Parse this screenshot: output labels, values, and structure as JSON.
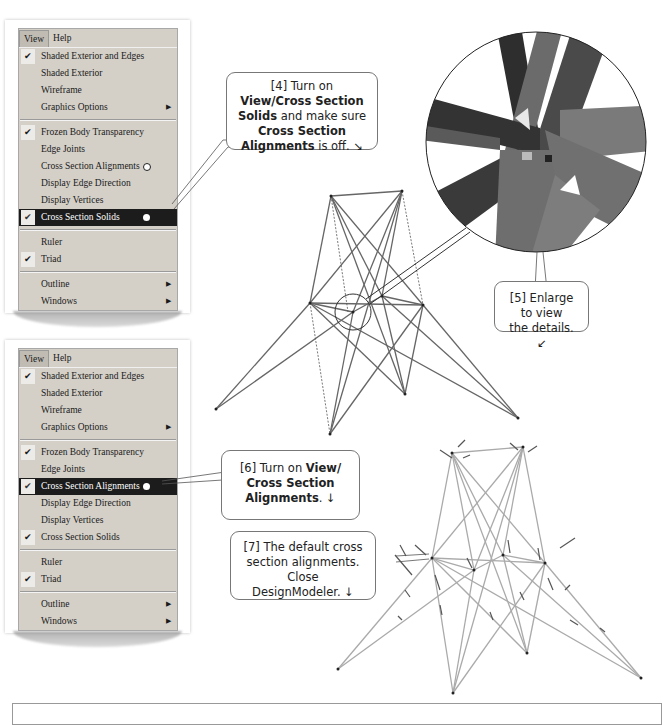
{
  "menu_1": {
    "menubar": [
      "View",
      "Help"
    ],
    "active_menu": "View",
    "items": [
      {
        "label": "Shaded Exterior and Edges",
        "checked": true
      },
      {
        "label": "Shaded Exterior",
        "checked": false
      },
      {
        "label": "Wireframe",
        "checked": false
      },
      {
        "label": "Graphics Options",
        "checked": false,
        "submenu": true
      },
      {
        "separator": true
      },
      {
        "label": "Frozen Body Transparency",
        "checked": true
      },
      {
        "label": "Edge Joints",
        "checked": false
      },
      {
        "label": "Cross Section Alignments",
        "checked": false,
        "marker": "hollow"
      },
      {
        "label": "Display Edge Direction",
        "checked": false
      },
      {
        "label": "Display Vertices",
        "checked": false
      },
      {
        "label": "Cross Section Solids",
        "checked": true,
        "highlighted": true,
        "marker": "solid"
      },
      {
        "separator": true
      },
      {
        "label": "Ruler",
        "checked": false
      },
      {
        "label": "Triad",
        "checked": true
      },
      {
        "separator": true
      },
      {
        "label": "Outline",
        "checked": false,
        "submenu": true
      },
      {
        "label": "Windows",
        "checked": false,
        "submenu": true
      }
    ]
  },
  "menu_2": {
    "menubar": [
      "View",
      "Help"
    ],
    "active_menu": "View",
    "items": [
      {
        "label": "Shaded Exterior and Edges",
        "checked": true
      },
      {
        "label": "Shaded Exterior",
        "checked": false
      },
      {
        "label": "Wireframe",
        "checked": false
      },
      {
        "label": "Graphics Options",
        "checked": false,
        "submenu": true
      },
      {
        "separator": true
      },
      {
        "label": "Frozen Body Transparency",
        "checked": true
      },
      {
        "label": "Edge Joints",
        "checked": false
      },
      {
        "label": "Cross Section Alignments",
        "checked": true,
        "highlighted": true,
        "marker": "solid"
      },
      {
        "label": "Display Edge Direction",
        "checked": false
      },
      {
        "label": "Display Vertices",
        "checked": false
      },
      {
        "label": "Cross Section Solids",
        "checked": true
      },
      {
        "separator": true
      },
      {
        "label": "Ruler",
        "checked": false
      },
      {
        "label": "Triad",
        "checked": true
      },
      {
        "separator": true
      },
      {
        "label": "Outline",
        "checked": false,
        "submenu": true
      },
      {
        "label": "Windows",
        "checked": false,
        "submenu": true
      }
    ]
  },
  "callouts": {
    "step4": {
      "prefix": "[4] Turn on ",
      "b1": "View/Cross Section Solids",
      "mid": " and make sure ",
      "b2": "Cross Section Alignments",
      "suffix": " is off. ↘"
    },
    "step5": {
      "text1": "[5] Enlarge to view",
      "text2": "the details. ↙"
    },
    "step6": {
      "prefix": "[6] Turn on ",
      "b1": "View/ Cross Section Alignments",
      "suffix": ". ↓"
    },
    "step7": {
      "text1": "[7] The default cross",
      "text2": "section alignments.  Close",
      "text3": "DesignModeler. ↓"
    }
  },
  "icons": {
    "check": "✔",
    "submenu_arrow": "▶"
  },
  "colors": {
    "menu_bg": "#d4d0c8",
    "highlight": "#1c1c1c",
    "callout_border": "#777777"
  }
}
